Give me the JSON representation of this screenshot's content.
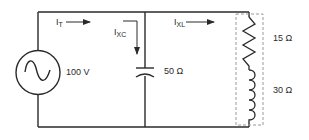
{
  "diagram": {
    "type": "parallel RLC circuit",
    "colors": {
      "wire": "#2a2a2a",
      "dashed_box": "#9a9a9a",
      "background": "#ffffff"
    },
    "source": {
      "symbol": "ac-voltage-source",
      "label": "100 V"
    },
    "currents": {
      "total": {
        "base": "I",
        "sub": "T"
      },
      "capacitor": {
        "base": "I",
        "sub": "XC"
      },
      "inductor_branch": {
        "base": "I",
        "sub": "XL"
      }
    },
    "capacitor": {
      "symbol": "capacitor",
      "label": "50 Ω"
    },
    "resistor": {
      "symbol": "resistor",
      "label": "15 Ω"
    },
    "inductor": {
      "symbol": "inductor",
      "label": "30 Ω"
    }
  }
}
